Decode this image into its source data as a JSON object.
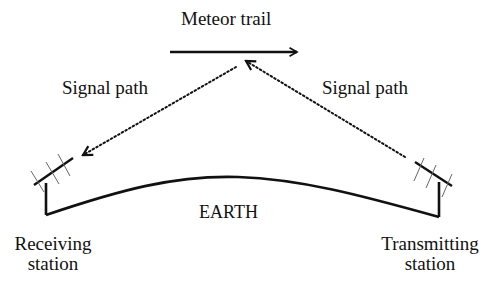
{
  "diagram": {
    "labels": {
      "meteor_trail": "Meteor trail",
      "signal_path_left": "Signal path",
      "signal_path_right": "Signal path",
      "earth": "EARTH",
      "receiving_station": [
        "Receiving",
        "station"
      ],
      "transmitting_station": [
        "Transmitting",
        "station"
      ]
    },
    "colors": {
      "line": "#111111",
      "antenna_element": "#555555",
      "background": "#ffffff"
    },
    "elements": {
      "meteor_trail_arrow": {
        "from": [
          170,
          52
        ],
        "to": [
          298,
          52
        ],
        "style": "solid",
        "head": "end"
      },
      "signal_path_left": {
        "from": [
          238,
          66
        ],
        "to": [
          82,
          156
        ],
        "style": "dotted",
        "head": "end"
      },
      "signal_path_right": {
        "from": [
          405,
          157
        ],
        "to": [
          245,
          61
        ],
        "style": "dotted",
        "head": "end"
      },
      "earth_surface": {
        "type": "arc",
        "start": [
          46,
          215
        ],
        "peak": [
          235,
          177
        ],
        "end": [
          439,
          217
        ]
      },
      "receiving_antenna": {
        "mast_x": 46,
        "mast_top": 183,
        "mast_bottom": 215,
        "boom": [
          [
            34,
            185
          ],
          [
            73,
            158
          ]
        ]
      },
      "transmitting_antenna": {
        "mast_x": 439,
        "mast_top": 182,
        "mast_bottom": 217,
        "boom": [
          [
            415,
            162
          ],
          [
            452,
            186
          ]
        ]
      }
    }
  }
}
